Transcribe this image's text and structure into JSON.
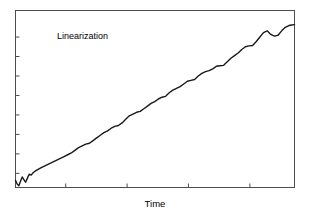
{
  "chart_data": {
    "type": "line",
    "title": "",
    "subtitle": "",
    "xlabel": "Time",
    "ylabel": "",
    "annotations": [
      {
        "text": "Linearization",
        "x_frac": 0.15,
        "y_frac": 0.12
      }
    ],
    "legend": [],
    "legend_position": "none",
    "grid": false,
    "xlim": [
      0,
      100
    ],
    "ylim": [
      0,
      100
    ],
    "x_tick_labels": [],
    "y_tick_labels": [],
    "x_ticks": [
      18,
      40,
      62,
      84
    ],
    "y_ticks": [
      8,
      19,
      30,
      41,
      52,
      63,
      74,
      85
    ],
    "tick_direction": "in",
    "axis_color": "#4d4d4d",
    "series": [
      {
        "name": "Linearization",
        "color": "#1a1a1a",
        "line_width": 1.4,
        "x": [
          0.0,
          0.6,
          1.2,
          1.8,
          2.4,
          3.0,
          3.6,
          4.2,
          4.9,
          5.6,
          6.4,
          7.3,
          8.4,
          9.6,
          10.9,
          12.2,
          13.5,
          14.8,
          16.1,
          17.4,
          18.7,
          20.0,
          21.3,
          22.6,
          23.9,
          25.2,
          26.5,
          27.8,
          29.1,
          30.4,
          31.7,
          33.0,
          34.3,
          35.6,
          36.9,
          38.2,
          39.5,
          40.8,
          42.1,
          43.4,
          44.7,
          46.0,
          47.3,
          48.6,
          49.9,
          51.2,
          52.5,
          53.8,
          55.1,
          56.4,
          57.7,
          59.0,
          60.3,
          61.6,
          62.9,
          64.2,
          65.5,
          66.8,
          68.1,
          69.4,
          70.7,
          72.0,
          73.3,
          74.6,
          75.9,
          77.2,
          78.5,
          79.8,
          81.1,
          82.4,
          83.7,
          85.0,
          86.3,
          87.6,
          88.9,
          90.2,
          91.5,
          92.8,
          94.1,
          95.4,
          96.7,
          98.0,
          99.0,
          100.0
        ],
        "y": [
          4.0,
          2.0,
          1.0,
          3.5,
          6.0,
          4.5,
          3.0,
          5.0,
          7.5,
          7.0,
          8.5,
          9.5,
          10.5,
          11.5,
          12.5,
          13.5,
          14.5,
          15.5,
          16.5,
          17.5,
          18.5,
          19.5,
          21.0,
          22.5,
          23.5,
          24.5,
          25.0,
          26.5,
          28.0,
          29.5,
          31.0,
          32.0,
          33.5,
          34.5,
          35.0,
          36.5,
          38.5,
          40.5,
          41.5,
          42.5,
          43.0,
          44.5,
          46.0,
          47.5,
          48.5,
          50.0,
          51.0,
          51.5,
          53.5,
          55.0,
          56.0,
          57.0,
          58.5,
          60.0,
          60.5,
          61.0,
          63.0,
          64.5,
          65.5,
          66.0,
          67.0,
          68.5,
          68.8,
          69.0,
          71.0,
          73.0,
          74.5,
          76.0,
          78.0,
          79.5,
          80.0,
          80.2,
          82.5,
          85.0,
          87.5,
          88.5,
          86.5,
          85.5,
          86.0,
          88.5,
          90.5,
          91.5,
          91.8,
          92.0
        ]
      }
    ]
  },
  "figure": {
    "background_color": "#ffffff",
    "frame_color": "#4d4d4d"
  }
}
